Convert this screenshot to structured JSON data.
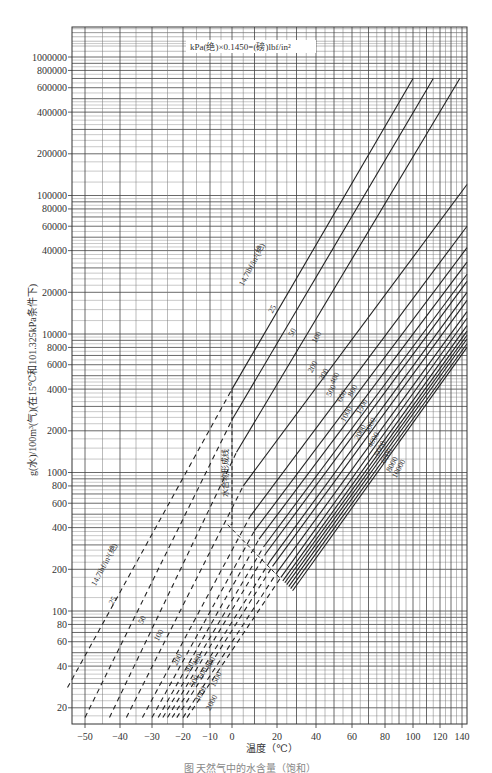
{
  "chart_data": {
    "type": "line",
    "title": "",
    "note": "kPa(绝)×0.1450=(磅)lbf/in²",
    "xlabel": "温度（℃）",
    "ylabel": "g(水)/100m³(气)(在15℃和101.325kPa条件下)",
    "caption": "图  天然气中的水含量（饱和）",
    "x_ticks": [
      -50,
      -40,
      -30,
      -20,
      -10,
      0,
      20,
      40,
      60,
      80,
      100,
      120,
      140
    ],
    "x_tick_px": [
      85,
      120,
      152,
      183,
      210,
      232,
      277,
      316,
      352,
      385,
      413,
      440,
      462
    ],
    "y_ticks": [
      20,
      40,
      60,
      80,
      100,
      200,
      400,
      600,
      800,
      1000,
      2000,
      4000,
      6000,
      8000,
      10000,
      20000,
      40000,
      60000,
      80000,
      100000,
      200000,
      400000,
      600000,
      800000,
      1000000
    ],
    "yscale": "log",
    "ylim": [
      17,
      2000000
    ],
    "xlim": [
      -55,
      145
    ],
    "grid": true,
    "hydrate_line_label": "水合物形成线",
    "hydrate_line": [
      [
        0,
        4000
      ],
      [
        0,
        420
      ],
      [
        -2,
        420
      ],
      [
        22,
        170
      ]
    ],
    "series": [
      {
        "name": "14.7 lbf/in²(绝)",
        "label": "14.7lbf/in²(绝)",
        "dashed": [
          [
            -55,
            28
          ],
          [
            0,
            4000
          ]
        ],
        "solid": [
          [
            0,
            4000
          ],
          [
            100,
            700000
          ]
        ]
      },
      {
        "name": "25",
        "label": "25",
        "dashed": [
          [
            -50,
            17
          ],
          [
            0,
            2400
          ]
        ],
        "solid": [
          [
            0,
            2400
          ],
          [
            115,
            700000
          ]
        ]
      },
      {
        "name": "50",
        "label": "50",
        "dashed": [
          [
            -43,
            17
          ],
          [
            2,
            1400
          ]
        ],
        "solid": [
          [
            2,
            1400
          ],
          [
            138,
            700000
          ]
        ]
      },
      {
        "name": "100",
        "label": "100",
        "dashed": [
          [
            -38,
            17
          ],
          [
            5,
            800
          ]
        ],
        "solid": [
          [
            5,
            800
          ],
          [
            145,
            120000
          ]
        ]
      },
      {
        "name": "200",
        "label": "200",
        "dashed": [
          [
            -33,
            17
          ],
          [
            8,
            480
          ]
        ],
        "solid": [
          [
            8,
            480
          ],
          [
            145,
            60000
          ]
        ]
      },
      {
        "name": "300",
        "label": "300",
        "dashed": [
          [
            -30,
            17
          ],
          [
            10,
            380
          ]
        ],
        "solid": [
          [
            10,
            380
          ],
          [
            145,
            42000
          ]
        ]
      },
      {
        "name": "400",
        "label": "400",
        "dashed": [
          [
            -28,
            17
          ],
          [
            12,
            330
          ]
        ],
        "solid": [
          [
            12,
            330
          ],
          [
            145,
            33000
          ]
        ]
      },
      {
        "name": "500",
        "label": "500",
        "dashed": [
          [
            -26.5,
            17
          ],
          [
            14,
            290
          ]
        ],
        "solid": [
          [
            14,
            290
          ],
          [
            145,
            27000
          ]
        ]
      },
      {
        "name": "600",
        "label": "600",
        "dashed": [
          [
            -25,
            17
          ],
          [
            15,
            260
          ]
        ],
        "solid": [
          [
            15,
            260
          ],
          [
            145,
            24000
          ]
        ]
      },
      {
        "name": "800",
        "label": "800",
        "dashed": [
          [
            -23.5,
            17
          ],
          [
            17,
            230
          ]
        ],
        "solid": [
          [
            17,
            230
          ],
          [
            145,
            20000
          ]
        ]
      },
      {
        "name": "1000",
        "label": "1000",
        "dashed": [
          [
            -22,
            17
          ],
          [
            18,
            210
          ]
        ],
        "solid": [
          [
            18,
            210
          ],
          [
            145,
            17500
          ]
        ]
      },
      {
        "name": "1500",
        "label": "1500",
        "dashed": [
          [
            -20,
            17
          ],
          [
            20,
            190
          ]
        ],
        "solid": [
          [
            20,
            190
          ],
          [
            145,
            14500
          ]
        ]
      },
      {
        "name": "2000",
        "label": "2000",
        "dashed": [
          [
            -18.5,
            17
          ],
          [
            22,
            175
          ]
        ],
        "solid": [
          [
            22,
            175
          ],
          [
            145,
            13000
          ]
        ]
      },
      {
        "name": "3000",
        "label": "3000",
        "dashed": [],
        "solid": [
          [
            23,
            165
          ],
          [
            145,
            11500
          ]
        ]
      },
      {
        "name": "4000",
        "label": "4000",
        "dashed": [],
        "solid": [
          [
            24,
            160
          ],
          [
            145,
            10500
          ]
        ]
      },
      {
        "name": "5000",
        "label": "5000",
        "dashed": [],
        "solid": [
          [
            25,
            155
          ],
          [
            145,
            9800
          ]
        ]
      },
      {
        "name": "6000",
        "label": "6000",
        "dashed": [],
        "solid": [
          [
            26,
            150
          ],
          [
            145,
            9200
          ]
        ]
      },
      {
        "name": "8000",
        "label": "8000",
        "dashed": [],
        "solid": [
          [
            27,
            145
          ],
          [
            145,
            8500
          ]
        ]
      },
      {
        "name": "10000",
        "label": "10000",
        "dashed": [],
        "solid": [
          [
            28,
            140
          ],
          [
            145,
            8000
          ]
        ]
      }
    ]
  },
  "frame": {
    "left": 72,
    "right": 467,
    "top": 27,
    "bottom": 724
  },
  "colors": {
    "line": "#222222",
    "grid_major": "#444444",
    "grid_minor": "#777777",
    "background": "#ffffff"
  }
}
